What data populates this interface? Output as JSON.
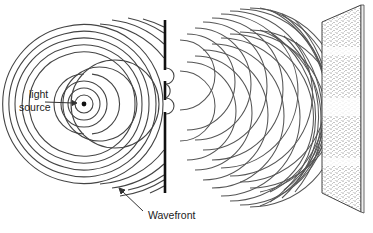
{
  "diagram": {
    "labels": {
      "light_line1": "light",
      "light_line2": "source",
      "wavefront": "Wavefront"
    },
    "elements": {
      "light_source": {
        "x": 84,
        "y": 104
      },
      "barrier": {
        "x": 165,
        "y_top": 20,
        "y_bottom": 193,
        "slits": [
          {
            "y_top": 70,
            "y_bottom": 81
          },
          {
            "y_top": 100,
            "y_bottom": 112
          }
        ]
      },
      "screen": {
        "points": [
          [
            322,
            22
          ],
          [
            361,
            5
          ],
          [
            361,
            212
          ],
          [
            322,
            193
          ]
        ],
        "bright_bands": 4
      }
    },
    "colors": {
      "line": "#444444",
      "barrier": "#111111",
      "background": "#ffffff",
      "stipple": "#555555"
    }
  }
}
